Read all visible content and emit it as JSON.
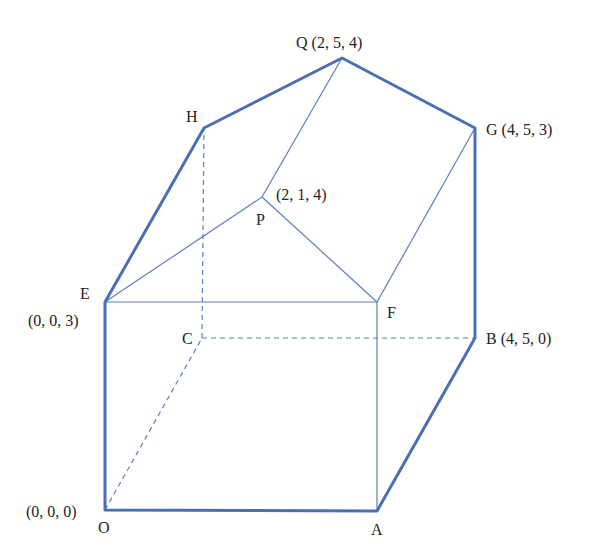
{
  "diagram": {
    "type": "3d-solid",
    "colors": {
      "edge": "#4a6fb5",
      "thin_edge": "#5b7fc2",
      "label": "#222222"
    },
    "vertices": {
      "O": {
        "name": "O",
        "coords": "(0, 0, 0)",
        "px": [
          105,
          510
        ]
      },
      "A": {
        "name": "A",
        "coords": "",
        "px": [
          377,
          511
        ]
      },
      "B": {
        "name": "B",
        "coords": "(4, 5, 0)",
        "px": [
          475,
          338
        ]
      },
      "C": {
        "name": "C",
        "coords": "",
        "px": [
          202,
          338
        ]
      },
      "E": {
        "name": "E",
        "coords": "(0, 0, 3)",
        "px": [
          105,
          302
        ]
      },
      "F": {
        "name": "F",
        "coords": "",
        "px": [
          377,
          302
        ]
      },
      "G": {
        "name": "G",
        "coords": "(4, 5, 3)",
        "px": [
          475,
          128
        ]
      },
      "H": {
        "name": "H",
        "coords": "",
        "px": [
          204,
          128
        ]
      },
      "P": {
        "name": "P",
        "coords": "(2, 1, 4)",
        "px": [
          262,
          197
        ]
      },
      "Q": {
        "name": "Q",
        "coords": "(2, 5, 4)",
        "px": [
          342,
          58
        ]
      }
    },
    "labels": {
      "Q": "Q (2, 5, 4)",
      "G": "G (4, 5, 3)",
      "H": "H",
      "P_coords": "(2, 1, 4)",
      "P": "P",
      "E": "E",
      "E_coords": "(0, 0, 3)",
      "C": "C",
      "F": "F",
      "B": "B (4, 5, 0)",
      "O_coords": "(0, 0, 0)",
      "O": "O",
      "A": "A"
    },
    "edges": {
      "thick": [
        "O-A",
        "A-B",
        "B-G",
        "G-Q",
        "Q-H",
        "H-E",
        "E-O"
      ],
      "thin": [
        "E-F",
        "F-A",
        "F-G",
        "E-P",
        "P-F",
        "P-Q"
      ],
      "hidden_dashed": [
        "O-C",
        "C-B",
        "C-H"
      ]
    }
  }
}
